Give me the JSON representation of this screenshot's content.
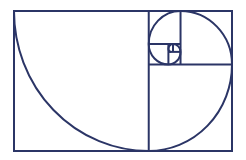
{
  "diagram": {
    "stroke_color": "#2b3566",
    "background": "#ffffff",
    "ratio": 1.618,
    "squares": [
      {
        "x": 0,
        "y": 0,
        "size": 1
      },
      {
        "x": 1,
        "y": 0.382,
        "size": 0.618
      },
      {
        "x": 1.236,
        "y": 0,
        "size": 0.382
      },
      {
        "x": 1,
        "y": 0,
        "size": 0.236
      },
      {
        "x": 1,
        "y": 0.236,
        "size": 0.146
      },
      {
        "x": 1.146,
        "y": 0.236,
        "size": 0.09
      },
      {
        "x": 1.18,
        "y": 0.236,
        "size": 0.056
      }
    ]
  }
}
